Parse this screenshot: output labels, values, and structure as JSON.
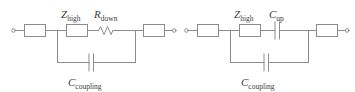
{
  "figure": {
    "type": "circuit-diagram",
    "background_color": "#ffffff",
    "line_color": "#8c8c8c",
    "text_color": "#3c3c3c"
  },
  "circuits": [
    {
      "id": "left",
      "name": "circuit-left",
      "components": [
        {
          "id": "left-box-in",
          "type": "box",
          "label": "",
          "label_sub": ""
        },
        {
          "id": "left-zhigh",
          "type": "box",
          "label": "Z",
          "label_sub": "high"
        },
        {
          "id": "left-rdown",
          "type": "resistor",
          "label": "R",
          "label_sub": "down"
        },
        {
          "id": "left-box-out",
          "type": "box",
          "label": "",
          "label_sub": ""
        },
        {
          "id": "left-ccoup",
          "type": "capacitor",
          "label": "C",
          "label_sub": "coupling"
        }
      ],
      "terminals": [
        "left-terminal-in",
        "left-terminal-out"
      ]
    },
    {
      "id": "right",
      "name": "circuit-right",
      "components": [
        {
          "id": "right-box-in",
          "type": "box",
          "label": "",
          "label_sub": ""
        },
        {
          "id": "right-zhigh",
          "type": "box",
          "label": "Z",
          "label_sub": "high"
        },
        {
          "id": "right-cup",
          "type": "capacitor",
          "label": "C",
          "label_sub": "up"
        },
        {
          "id": "right-box-out",
          "type": "box",
          "label": "",
          "label_sub": ""
        },
        {
          "id": "right-ccoup",
          "type": "capacitor",
          "label": "C",
          "label_sub": "coupling"
        }
      ],
      "terminals": [
        "right-terminal-in",
        "right-terminal-out"
      ]
    }
  ],
  "labels": {
    "left_zhigh_main": "Z",
    "left_zhigh_sub": "high",
    "left_rdown_main": "R",
    "left_rdown_sub": "down",
    "left_ccoupling_main": "C",
    "left_ccoupling_sub": "coupling",
    "right_zhigh_main": "Z",
    "right_zhigh_sub": "high",
    "right_cup_main": "C",
    "right_cup_sub": "up",
    "right_ccoupling_main": "C",
    "right_ccoupling_sub": "coupling"
  }
}
